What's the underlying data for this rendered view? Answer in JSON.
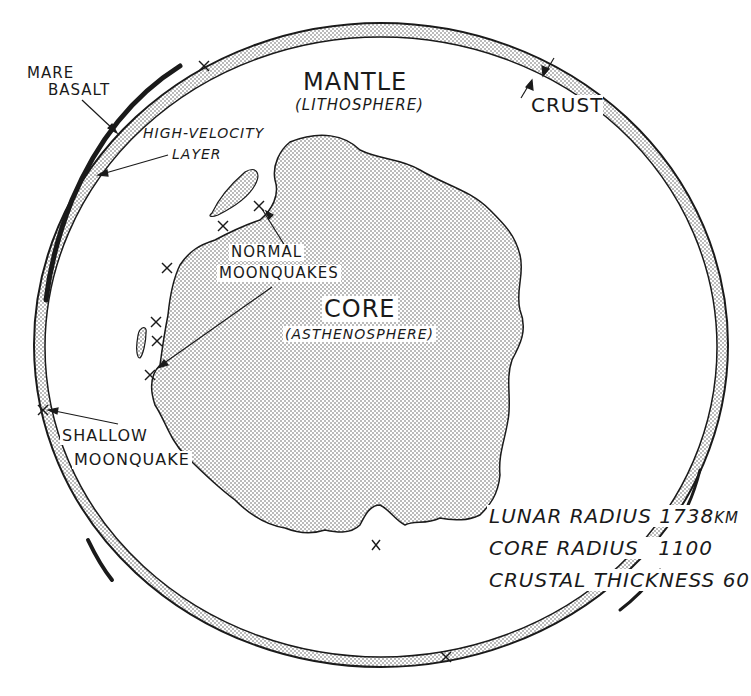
{
  "figure": {
    "colors": {
      "ink": "#1a1a1a",
      "stipple": "#555555",
      "background": "#ffffff"
    }
  },
  "layers": {
    "mantle": {
      "label": "MANTLE",
      "sublabel": "(LITHOSPHERE)"
    },
    "core": {
      "label": "CORE",
      "sublabel": "(ASTHENOSPHERE)"
    },
    "crust": {
      "label": "CRUST"
    }
  },
  "annotations": {
    "mare_basalt": {
      "line1": "MARE",
      "line2": "BASALT"
    },
    "high_velocity_layer": {
      "line1": "HIGH-VELOCITY",
      "line2": "LAYER"
    },
    "normal_moonquakes": {
      "line1": "NORMAL",
      "line2": "MOONQUAKES"
    },
    "shallow_moonquake": {
      "line1": "SHALLOW",
      "line2": "MOONQUAKE"
    }
  },
  "dimensions": {
    "lunar_radius": {
      "label": "LUNAR RADIUS",
      "value": "1738",
      "unit": "KM"
    },
    "core_radius": {
      "label": "CORE RADIUS",
      "value": "1100"
    },
    "crustal_thickness": {
      "label": "CRUSTAL THICKNESS",
      "value": "60"
    }
  },
  "markers": {
    "symbol": "×",
    "moonquake_positions": [
      {
        "x": 204,
        "y": 66
      },
      {
        "x": 223,
        "y": 226
      },
      {
        "x": 259,
        "y": 206
      },
      {
        "x": 167,
        "y": 268
      },
      {
        "x": 156,
        "y": 322
      },
      {
        "x": 157,
        "y": 341
      },
      {
        "x": 150,
        "y": 375
      },
      {
        "x": 43,
        "y": 410
      },
      {
        "x": 376,
        "y": 545
      },
      {
        "x": 446,
        "y": 657
      }
    ]
  }
}
